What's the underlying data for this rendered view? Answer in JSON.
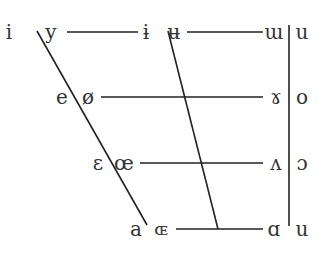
{
  "diagram": {
    "type": "ipa-vowel-chart",
    "rows": [
      {
        "name": "close",
        "symbols": [
          "i",
          "y",
          "ɨ",
          "ʉ",
          "ɯ",
          "u"
        ]
      },
      {
        "name": "close-mid",
        "symbols": [
          "e",
          "ø",
          "ɤ",
          "o"
        ]
      },
      {
        "name": "open-mid",
        "symbols": [
          "ɛ",
          "œ",
          "ʌ",
          "ɔ"
        ]
      },
      {
        "name": "open",
        "symbols": [
          "a",
          "ɶ",
          "ɑ",
          "u"
        ]
      }
    ],
    "line_color": "#222222",
    "text_color": "#333333"
  }
}
